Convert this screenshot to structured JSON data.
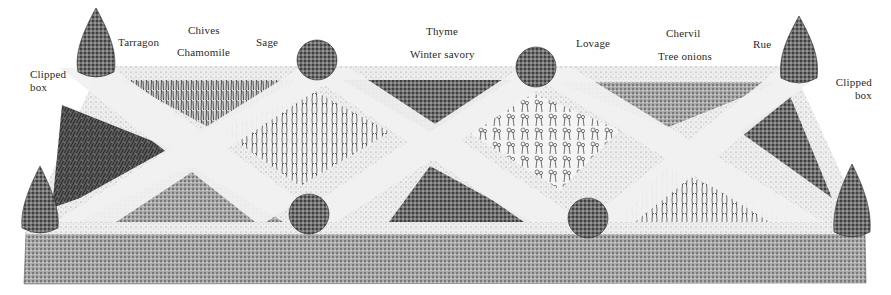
{
  "diagram": {
    "title": "",
    "type": "herb knot garden illustration",
    "colors": {
      "background": "#ffffff",
      "hedge_dark": "#3a3a3a",
      "hedge_mid": "#7a7a7a",
      "path_light": "#e9e9e9",
      "bed_dark": "#4b4b4b",
      "bed_mid": "#8c8c8c",
      "bed_light": "#cfcfcf",
      "ink": "#1e1e1e"
    }
  },
  "labels": {
    "clipped_box_left": {
      "line1": "Clipped",
      "line2": "box"
    },
    "tarragon": "Tarragon",
    "chives": "Chives",
    "chamomile": "Chamomile",
    "sage": "Sage",
    "thyme": "Thyme",
    "winter_savory": "Winter savory",
    "lovage": "Lovage",
    "chervil": "Chervil",
    "tree_onions": "Tree onions",
    "rue": "Rue",
    "clipped_box_right": {
      "line1": "Clipped",
      "line2": "box"
    }
  },
  "beds": [
    {
      "name": "tarragon-bed",
      "plant": "Tarragon"
    },
    {
      "name": "chives-bed",
      "plant": "Chives"
    },
    {
      "name": "chamomile-bed",
      "plant": "Chamomile"
    },
    {
      "name": "sage-bed",
      "plant": "Sage"
    },
    {
      "name": "thyme-bed",
      "plant": "Thyme"
    },
    {
      "name": "winter-savory-bed",
      "plant": "Winter savory"
    },
    {
      "name": "lovage-bed",
      "plant": "Lovage"
    },
    {
      "name": "chervil-bed",
      "plant": "Chervil"
    },
    {
      "name": "tree-onions-bed",
      "plant": "Tree onions"
    },
    {
      "name": "rue-bed",
      "plant": "Rue"
    }
  ]
}
